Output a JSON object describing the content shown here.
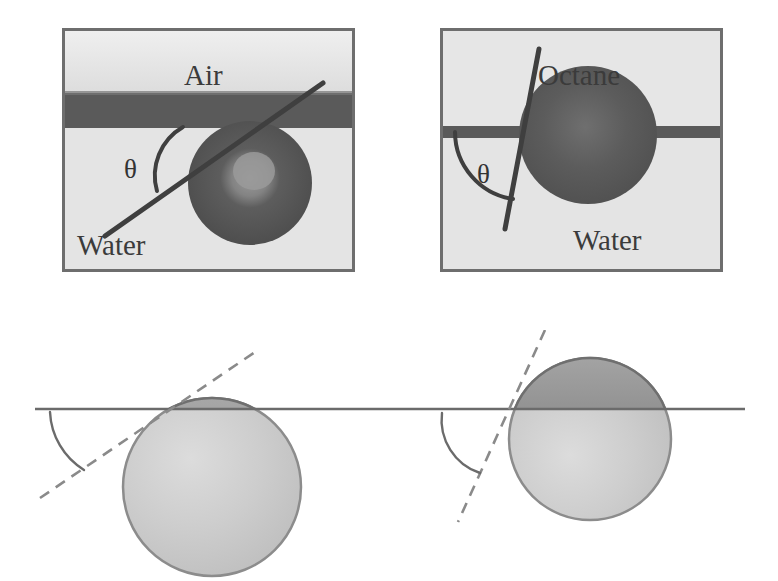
{
  "figure": {
    "type": "scientific-figure",
    "panel_count": 4,
    "colors": {
      "photo_background": "#e3e3e3",
      "photo_border": "#6e6e6e",
      "dark_phase": "#585858",
      "particle_dark": "#575757",
      "schematic_sphere": "#cfcfcf",
      "schematic_cap": "#8e8e8e",
      "line": "#6b6b6b",
      "text": "#3b3b3b"
    }
  },
  "photos": {
    "left": {
      "name": "air-water-photo",
      "upper_phase_label": "Air",
      "lower_phase_label": "Water",
      "angle_label": "θ",
      "interface_style": "thick-dark-band",
      "particle_position": "mostly-in-lower-phase",
      "contact_angle_description": "acute"
    },
    "right": {
      "name": "octane-water-photo",
      "upper_phase_label": "Octane",
      "lower_phase_label": "Water",
      "angle_label": "θ",
      "interface_style": "thin-dark-line",
      "particle_position": "straddling-interface",
      "contact_angle_description": "obtuse"
    }
  },
  "schematics": {
    "left": {
      "name": "air-water-schematic",
      "sphere_immersion": "small-cap-above-interface",
      "tangent_style": "dashed",
      "arc_label": "",
      "contact_angle_description": "acute"
    },
    "right": {
      "name": "octane-water-schematic",
      "sphere_immersion": "half-above-interface",
      "tangent_style": "dashed",
      "arc_label": "",
      "contact_angle_description": "obtuse"
    }
  }
}
